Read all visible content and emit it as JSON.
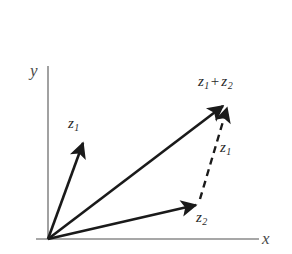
{
  "figure": {
    "type": "vector-diagram",
    "title": "",
    "background_color": "#ffffff",
    "axis_color": "#8a8a8a",
    "vector_color": "#1a1a1a",
    "label_color": "#2a2a2a",
    "axis_label_color": "#4a4a4a"
  },
  "axes": {
    "origin": {
      "x": 48,
      "y": 239
    },
    "x_axis": {
      "label": "x",
      "from": {
        "x": 36,
        "y": 239
      },
      "to": {
        "x": 259,
        "y": 239
      },
      "label_pos": {
        "x": 262,
        "y": 230
      }
    },
    "y_axis": {
      "label": "y",
      "from": {
        "x": 48,
        "y": 239
      },
      "to": {
        "x": 48,
        "y": 66
      },
      "label_pos": {
        "x": 30,
        "y": 62
      }
    }
  },
  "vectors": [
    {
      "name": "z1-from-origin",
      "label": "z",
      "subscript": "1",
      "style": "solid",
      "from": {
        "x": 48,
        "y": 239
      },
      "to": {
        "x": 83,
        "y": 141
      },
      "label_pos": {
        "x": 68,
        "y": 116
      }
    },
    {
      "name": "z2-from-origin",
      "label": "z",
      "subscript": "2",
      "style": "solid",
      "from": {
        "x": 48,
        "y": 239
      },
      "to": {
        "x": 197,
        "y": 204
      },
      "label_pos": {
        "x": 196,
        "y": 210
      }
    },
    {
      "name": "z1-plus-z2-resultant",
      "label": "z",
      "subscript": "1",
      "label2": "z",
      "subscript2": "2",
      "operator": "+",
      "style": "solid",
      "from": {
        "x": 48,
        "y": 239
      },
      "to": {
        "x": 224,
        "y": 104
      },
      "label_pos": {
        "x": 198,
        "y": 74
      }
    },
    {
      "name": "z1-translated",
      "label": "z",
      "subscript": "1",
      "style": "dashed",
      "dash_pattern": "7 5",
      "from": {
        "x": 200,
        "y": 199
      },
      "to": {
        "x": 228,
        "y": 105
      },
      "label_pos": {
        "x": 220,
        "y": 140
      }
    }
  ],
  "labels": {
    "y_axis": "y",
    "x_axis": "x",
    "z1_origin": {
      "base": "z",
      "sub": "1"
    },
    "z2_origin": {
      "base": "z",
      "sub": "2"
    },
    "z1_translated": {
      "base": "z",
      "sub": "1"
    },
    "sum": {
      "base1": "z",
      "sub1": "1",
      "op": "+",
      "base2": "z",
      "sub2": "2"
    }
  }
}
